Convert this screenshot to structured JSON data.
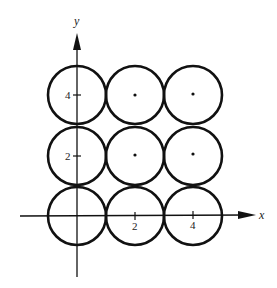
{
  "diagram": {
    "axes": {
      "x_label": "x",
      "y_label": "y",
      "x_ticks": [
        {
          "value": 2,
          "label": "2"
        },
        {
          "value": 4,
          "label": "4"
        }
      ],
      "y_ticks": [
        {
          "value": 2,
          "label": "2"
        },
        {
          "value": 4,
          "label": "4"
        }
      ]
    },
    "circles": [
      {
        "cx": 0,
        "cy": 0,
        "r": 1,
        "center_dot": false
      },
      {
        "cx": 2,
        "cy": 0,
        "r": 1,
        "center_dot": false
      },
      {
        "cx": 4,
        "cy": 0,
        "r": 1,
        "center_dot": false
      },
      {
        "cx": 0,
        "cy": 2,
        "r": 1,
        "center_dot": false
      },
      {
        "cx": 2,
        "cy": 2,
        "r": 1,
        "center_dot": true
      },
      {
        "cx": 4,
        "cy": 2,
        "r": 1,
        "center_dot": true
      },
      {
        "cx": 0,
        "cy": 4,
        "r": 1,
        "center_dot": false
      },
      {
        "cx": 2,
        "cy": 4,
        "r": 1,
        "center_dot": true
      },
      {
        "cx": 4,
        "cy": 4,
        "r": 1,
        "center_dot": true
      }
    ],
    "colors": {
      "stroke": "#111111",
      "background": "#ffffff"
    }
  }
}
